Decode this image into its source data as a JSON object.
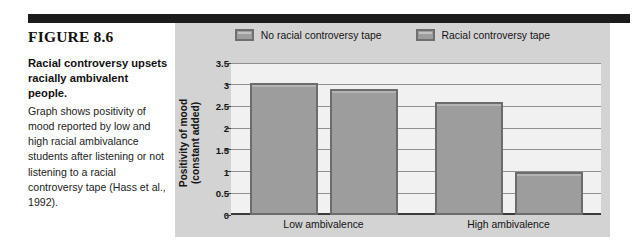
{
  "figure": {
    "label": "FIGURE 8.6",
    "label_word": "IGURE",
    "headline": "Racial controversy upsets racially ambivalent people.",
    "body": "Graph shows positivity of mood reported by low and high racial ambivalance students after listening or not listening to a racial controversy tape (Hass et al., 1992)."
  },
  "colors": {
    "rule": "#1c1c1c",
    "panel_bg": "#d3d3d3",
    "plot_bg": "#f1f1f1",
    "bar_fill": "#9d9d9d",
    "bar_border": "#6c6c6c",
    "gridline": "#8f8f8f",
    "axis": "#3a3a3a",
    "text": "#141414"
  },
  "chart_data": {
    "type": "bar",
    "title": "",
    "xlabel": "",
    "ylabel": "Positivity of mood (constant added)",
    "ylabel_line1": "Positivity of mood",
    "ylabel_line2": "(constant added)",
    "categories": [
      "Low ambivalence",
      "High ambivalence"
    ],
    "series": [
      {
        "name": "No racial controversy tape",
        "values": [
          3.05,
          2.6
        ]
      },
      {
        "name": "Racial controversy tape",
        "values": [
          2.9,
          1.0
        ]
      }
    ],
    "ylim": [
      0,
      3.5
    ],
    "yticks": [
      0,
      0.5,
      1,
      1.5,
      2,
      2.5,
      3,
      3.5
    ],
    "ytick_labels": [
      "0",
      "0.5",
      "1",
      "1.5",
      "2",
      "2.5",
      "3",
      "3.5"
    ],
    "grid": true,
    "legend_position": "top-center",
    "bars": [
      {
        "group": 0,
        "series": 0,
        "label": "No racial controversy tape",
        "category": "Low ambivalence",
        "value": 3.05
      },
      {
        "group": 0,
        "series": 1,
        "label": "Racial controversy tape",
        "category": "Low ambivalence",
        "value": 2.9
      },
      {
        "group": 1,
        "series": 0,
        "label": "No racial controversy tape",
        "category": "High ambivalence",
        "value": 2.6
      },
      {
        "group": 1,
        "series": 1,
        "label": "Racial controversy tape",
        "category": "High ambivalence",
        "value": 1.0
      }
    ]
  }
}
